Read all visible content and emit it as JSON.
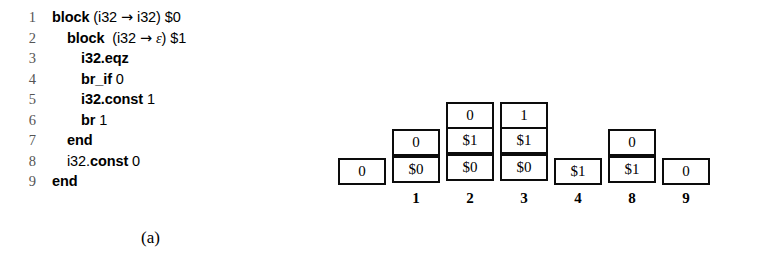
{
  "figure_a": {
    "caption": "(a)",
    "code_lines": [
      {
        "no": "1",
        "indent": 1,
        "tokens": [
          {
            "t": "block",
            "style": "kw"
          },
          {
            "t": " (i32 ",
            "style": "op"
          },
          {
            "t": "→",
            "style": "arrow"
          },
          {
            "t": " i32) $0",
            "style": "op"
          }
        ]
      },
      {
        "no": "2",
        "indent": 2,
        "tokens": [
          {
            "t": "block",
            "style": "kw"
          },
          {
            "t": "  (i32 ",
            "style": "op"
          },
          {
            "t": "→",
            "style": "arrow"
          },
          {
            "t": " ",
            "style": "op"
          },
          {
            "t": "ε",
            "style": "eps"
          },
          {
            "t": ") $1",
            "style": "op"
          }
        ]
      },
      {
        "no": "3",
        "indent": 3,
        "tokens": [
          {
            "t": "i32.eqz",
            "style": "kw"
          }
        ]
      },
      {
        "no": "4",
        "indent": 3,
        "tokens": [
          {
            "t": "br_if",
            "style": "kw"
          },
          {
            "t": " 0",
            "style": "op"
          }
        ]
      },
      {
        "no": "5",
        "indent": 3,
        "tokens": [
          {
            "t": "i32.const",
            "style": "kw"
          },
          {
            "t": " 1",
            "style": "op"
          }
        ]
      },
      {
        "no": "6",
        "indent": 3,
        "tokens": [
          {
            "t": "br",
            "style": "kw"
          },
          {
            "t": " 1",
            "style": "op"
          }
        ]
      },
      {
        "no": "7",
        "indent": 2,
        "tokens": [
          {
            "t": "end",
            "style": "kw"
          }
        ]
      },
      {
        "no": "8",
        "indent": 2,
        "tokens": [
          {
            "t": "i32.",
            "style": "op"
          },
          {
            "t": "const",
            "style": "kw"
          },
          {
            "t": " 0",
            "style": "op"
          }
        ]
      },
      {
        "no": "9",
        "indent": 1,
        "tokens": [
          {
            "t": "end",
            "style": "kw"
          }
        ]
      }
    ]
  },
  "figure_b": {
    "caption": "(b)",
    "note": "stack snapshots; cells listed bottom-to-top",
    "columns": [
      {
        "label": "",
        "x": 8,
        "cells": [
          "0"
        ]
      },
      {
        "label": "1",
        "x": 62,
        "cells": [
          "$0",
          "0"
        ]
      },
      {
        "label": "2",
        "x": 116,
        "cells": [
          "$0",
          "$1",
          "0"
        ]
      },
      {
        "label": "3",
        "x": 170,
        "cells": [
          "$0",
          "$1",
          "1"
        ]
      },
      {
        "label": "4",
        "x": 224,
        "cells": [
          "$1"
        ]
      },
      {
        "label": "8",
        "x": 278,
        "cells": [
          "$1",
          "0"
        ]
      },
      {
        "label": "9",
        "x": 332,
        "cells": [
          "0"
        ]
      }
    ],
    "cell_width": 48,
    "cell_height": 27,
    "baseline_y": 185,
    "label_y": 190
  },
  "colors": {
    "background": "#ffffff",
    "ink": "#000000",
    "line_number": "#555555",
    "box_border": "#0c0c0c"
  }
}
